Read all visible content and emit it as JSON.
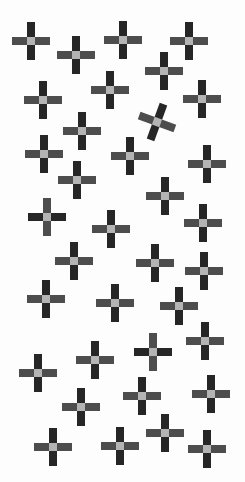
{
  "colors": {
    "background": "#fdfdfd",
    "dark": "#262626",
    "mid": "#4d4d4d",
    "center": "#b4b4b4"
  },
  "crosses": [
    {
      "x": 31,
      "y": 41,
      "rot": 0,
      "inverted": false
    },
    {
      "x": 76,
      "y": 55,
      "rot": 0,
      "inverted": false
    },
    {
      "x": 123,
      "y": 40,
      "rot": 0,
      "inverted": false
    },
    {
      "x": 189,
      "y": 41,
      "rot": 0,
      "inverted": false
    },
    {
      "x": 164,
      "y": 71,
      "rot": 0,
      "inverted": false
    },
    {
      "x": 43,
      "y": 100,
      "rot": 0,
      "inverted": false
    },
    {
      "x": 110,
      "y": 90,
      "rot": 0,
      "inverted": false
    },
    {
      "x": 202,
      "y": 99,
      "rot": 0,
      "inverted": false
    },
    {
      "x": 157,
      "y": 122,
      "rot": 20,
      "inverted": false
    },
    {
      "x": 82,
      "y": 131,
      "rot": 0,
      "inverted": false
    },
    {
      "x": 44,
      "y": 154,
      "rot": 0,
      "inverted": false
    },
    {
      "x": 130,
      "y": 156,
      "rot": 0,
      "inverted": false
    },
    {
      "x": 207,
      "y": 164,
      "rot": 0,
      "inverted": false
    },
    {
      "x": 77,
      "y": 180,
      "rot": 0,
      "inverted": false
    },
    {
      "x": 165,
      "y": 196,
      "rot": 0,
      "inverted": false
    },
    {
      "x": 47,
      "y": 217,
      "rot": 0,
      "inverted": true
    },
    {
      "x": 203,
      "y": 223,
      "rot": 0,
      "inverted": false
    },
    {
      "x": 111,
      "y": 229,
      "rot": 0,
      "inverted": false
    },
    {
      "x": 74,
      "y": 261,
      "rot": 0,
      "inverted": false
    },
    {
      "x": 155,
      "y": 263,
      "rot": 0,
      "inverted": false
    },
    {
      "x": 204,
      "y": 271,
      "rot": 0,
      "inverted": false
    },
    {
      "x": 46,
      "y": 299,
      "rot": 0,
      "inverted": false
    },
    {
      "x": 115,
      "y": 303,
      "rot": 0,
      "inverted": false
    },
    {
      "x": 179,
      "y": 306,
      "rot": 0,
      "inverted": false
    },
    {
      "x": 205,
      "y": 341,
      "rot": 0,
      "inverted": false
    },
    {
      "x": 153,
      "y": 352,
      "rot": 0,
      "inverted": true
    },
    {
      "x": 95,
      "y": 360,
      "rot": 0,
      "inverted": false
    },
    {
      "x": 38,
      "y": 373,
      "rot": 0,
      "inverted": false
    },
    {
      "x": 142,
      "y": 396,
      "rot": 0,
      "inverted": false
    },
    {
      "x": 211,
      "y": 394,
      "rot": 0,
      "inverted": false
    },
    {
      "x": 81,
      "y": 407,
      "rot": 0,
      "inverted": false
    },
    {
      "x": 165,
      "y": 433,
      "rot": 0,
      "inverted": false
    },
    {
      "x": 120,
      "y": 446,
      "rot": 0,
      "inverted": false
    },
    {
      "x": 53,
      "y": 447,
      "rot": 0,
      "inverted": false
    },
    {
      "x": 207,
      "y": 449,
      "rot": 0,
      "inverted": false
    }
  ]
}
